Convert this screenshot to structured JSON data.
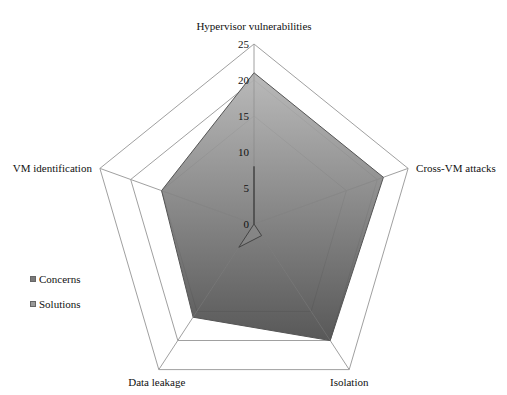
{
  "chart_data": {
    "type": "radar",
    "title": "",
    "categories": [
      "Hypervisor vulnerabilities",
      "Cross-VM attacks",
      "Isolation",
      "Data leakage",
      "VM identification"
    ],
    "series": [
      {
        "name": "Concerns",
        "values": [
          21,
          21,
          20,
          16,
          15
        ],
        "color_top": "#b4b4b4",
        "color_bottom": "#4a4a4a"
      },
      {
        "name": "Solutions",
        "values": [
          8,
          0,
          2,
          4,
          0
        ],
        "color": "#8a8a8a"
      }
    ],
    "rlim": [
      0,
      25
    ],
    "ticks": [
      0,
      5,
      10,
      15,
      20,
      25
    ],
    "grid_rings": [
      15,
      20,
      25
    ],
    "grid_color": "#a0a0a0",
    "legend_position": "left"
  },
  "legend": {
    "items": [
      {
        "label": "Concerns",
        "color": "#7a7a7a"
      },
      {
        "label": "Solutions",
        "color": "#9a9a9a"
      }
    ]
  }
}
